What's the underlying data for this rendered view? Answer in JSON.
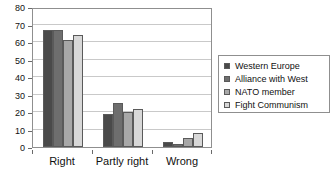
{
  "chart_data": {
    "type": "bar",
    "title": "",
    "subtitle": "",
    "xlabel": "",
    "ylabel": "",
    "categories": [
      "Right",
      "Partly right",
      "Wrong"
    ],
    "series": [
      {
        "name": "Western Europe",
        "values": [
          67,
          19,
          3
        ],
        "color": "#4a4a4a"
      },
      {
        "name": "Alliance with West",
        "values": [
          67,
          25,
          2
        ],
        "color": "#6e6e6e"
      },
      {
        "name": "NATO member",
        "values": [
          61,
          20,
          5
        ],
        "color": "#a8a8a8"
      },
      {
        "name": "Fight Communism",
        "values": [
          64,
          22,
          8
        ],
        "color": "#d8d8d8"
      }
    ],
    "ylim": [
      0,
      80
    ],
    "y_ticks": [
      0,
      10,
      20,
      30,
      40,
      50,
      60,
      70,
      80
    ],
    "y_tick_labels": [
      "0",
      "10",
      "20",
      "30",
      "40",
      "50",
      "60",
      "70",
      "80"
    ],
    "grid": true,
    "grid_axis": "y",
    "legend_position": "right",
    "legend_border": true,
    "plot_border": true,
    "bar_edge_color": "#5a5a5a",
    "grid_color": "#c9c9c9",
    "axis_color": "#8f8f8f",
    "background_color": "#ffffff",
    "text_color": "#111111"
  }
}
